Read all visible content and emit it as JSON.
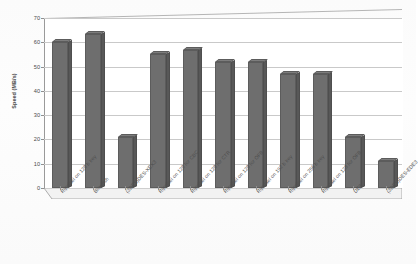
{
  "chart_data": {
    "type": "bar",
    "title": "",
    "xlabel": "",
    "ylabel": "Speed (MB/s)",
    "ylim": [
      0,
      70
    ],
    "yticks": [
      0,
      10,
      20,
      30,
      40,
      50,
      60,
      70
    ],
    "grid": true,
    "legend": "none",
    "style": "3d-column-grayscale",
    "categories": [
      "Rijndael on 128 b key",
      "Blowfish",
      "(3DES)DES-XEX3",
      "Rijndael on 128 for CBC",
      "Rijndael on 128 for CTR",
      "Rijndael on 128 for OFB",
      "Rijndael on 192 b key",
      "Rijndael on 256 b key",
      "Rijndael on 128 for OFB",
      "DES",
      "(3DES)DES-EDE3"
    ],
    "values": [
      60,
      63.5,
      21,
      55,
      57,
      52,
      52,
      47,
      47,
      21,
      11
    ],
    "series": [
      {
        "name": "Speed",
        "values": [
          60,
          63.5,
          21,
          55,
          57,
          52,
          52,
          47,
          47,
          21,
          11
        ]
      }
    ],
    "colors": {
      "bar_front": "#6e6e6e",
      "bar_side": "#585858",
      "bar_top": "#7d7d7d",
      "gridline": "#c9c9c9",
      "axis": "#8f8f8f",
      "text": "#4a4a4a",
      "background": "#ffffff"
    }
  }
}
